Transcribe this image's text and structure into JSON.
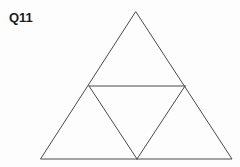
{
  "figure": {
    "label": "Q11",
    "label_name": "question-number",
    "background_color": "#fdfdfd",
    "stroke_color": "#4a4a4a",
    "stroke_width": 1,
    "canvas": {
      "width": 240,
      "height": 167
    },
    "points": {
      "apex": {
        "name": "apex",
        "x": 136,
        "y": 12
      },
      "bottom_left": {
        "name": "bottom-left-corner",
        "x": 41,
        "y": 159
      },
      "bottom_right": {
        "name": "bottom-right-corner",
        "x": 232,
        "y": 159
      },
      "left_mid": {
        "name": "left-edge-midpoint",
        "x": 89,
        "y": 86
      },
      "right_mid": {
        "name": "right-edge-midpoint",
        "x": 185,
        "y": 86
      },
      "bottom_mid": {
        "name": "base-midpoint",
        "x": 137,
        "y": 159
      }
    },
    "paths": {
      "outer_triangle": "M 136 12 L 232 159 L 41 159 Z",
      "midsegment_horizontal": "M 89 86 L 185 86",
      "midsegment_left": "M 89 86 L 137 159",
      "midsegment_right": "M 137 159 L 185 86"
    },
    "regions": [
      {
        "name": "top-sub-triangle",
        "vertices": "apex, left_mid, right_mid"
      },
      {
        "name": "bottom-left-sub-triangle",
        "vertices": "left_mid, bottom_left, bottom_mid"
      },
      {
        "name": "bottom-right-sub-triangle",
        "vertices": "right_mid, bottom_mid, bottom_right"
      },
      {
        "name": "center-inverted-triangle",
        "vertices": "left_mid, right_mid, bottom_mid"
      }
    ]
  }
}
